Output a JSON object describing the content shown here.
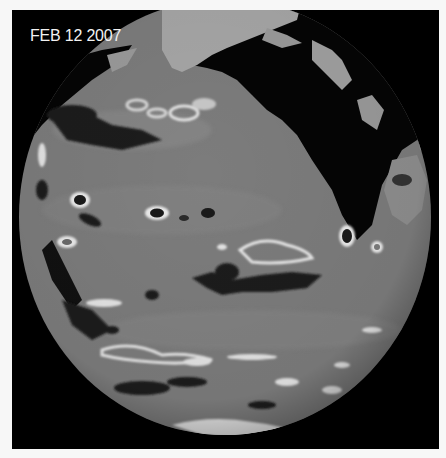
{
  "figure": {
    "date_label": "FEB 12 2007",
    "colors": {
      "background": "#000000",
      "frame": "#f7f7f7",
      "ocean_base": "#7c7c7c",
      "land": "#050505",
      "ice_snow": "#a8a8a8",
      "high_anomaly": "#e8e8e8",
      "low_anomaly": "#1a1a1a",
      "label_text": "#f2f2f2"
    }
  }
}
